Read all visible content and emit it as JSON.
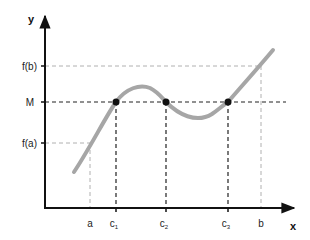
{
  "diagram": {
    "type": "function-graph",
    "axes": {
      "x_label": "x",
      "y_label": "y"
    },
    "y_ticks": [
      {
        "id": "fb",
        "label": "f(b)"
      },
      {
        "id": "M",
        "label": "M"
      },
      {
        "id": "fa",
        "label": "f(a)"
      }
    ],
    "x_ticks": [
      {
        "id": "a",
        "label": "a"
      },
      {
        "id": "c1",
        "label": "c",
        "sub": "1"
      },
      {
        "id": "c2",
        "label": "c",
        "sub": "2"
      },
      {
        "id": "c3",
        "label": "c",
        "sub": "3"
      },
      {
        "id": "b",
        "label": "b"
      }
    ],
    "points": [
      {
        "id": "c1",
        "label": "(c1, M)"
      },
      {
        "id": "c2",
        "label": "(c2, M)"
      },
      {
        "id": "c3",
        "label": "(c3, M)"
      }
    ],
    "colors": {
      "axis": "#111111",
      "curve": "#a6a6a6",
      "dashed_strong": "#222222",
      "dashed_light": "#b0b0b0",
      "point": "#111111"
    }
  }
}
